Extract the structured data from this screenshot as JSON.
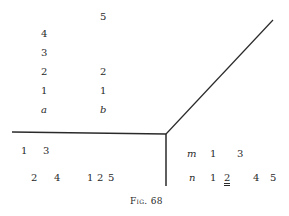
{
  "caption": "Fig. 68",
  "column_a": {
    "label": "a",
    "numbers": [
      "1",
      "2",
      "3",
      "4"
    ]
  },
  "column_b": {
    "label": "b",
    "numbers": [
      "1",
      "2",
      "5"
    ]
  },
  "lower_left": {
    "row1": [
      "1",
      "3"
    ],
    "row2": [
      "2",
      "4"
    ],
    "row2_group": [
      "1",
      "2",
      "5"
    ]
  },
  "lower_right": {
    "row_m": {
      "label": "m",
      "values": [
        "1",
        "3"
      ]
    },
    "row_n": {
      "label": "n",
      "values": [
        "1",
        "2",
        "4",
        "5"
      ],
      "underlined_index": 1
    }
  },
  "colors": {
    "ink": "#2a2a2a",
    "background": "#ffffff"
  }
}
